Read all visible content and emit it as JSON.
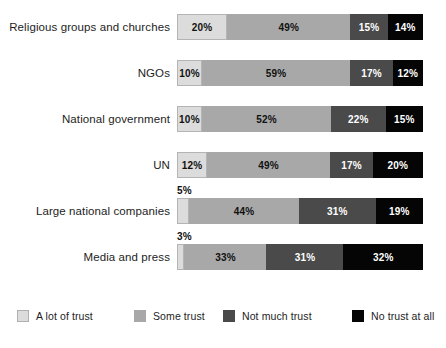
{
  "chart_data": {
    "type": "bar",
    "orientation": "horizontal",
    "stacked": true,
    "normalized_percent": true,
    "title": "",
    "xlabel": "",
    "ylabel": "",
    "xlim": [
      0,
      100
    ],
    "grid": false,
    "legend_position": "bottom",
    "categories": [
      "Religious groups and churches",
      "NGOs",
      "National government",
      "UN",
      "Large national companies",
      "Media and press"
    ],
    "series": [
      {
        "name": "A lot of trust",
        "color": "#dcdcdc",
        "values": [
          20,
          10,
          10,
          12,
          5,
          3
        ]
      },
      {
        "name": "Some trust",
        "color": "#a8a8a8",
        "values": [
          49,
          59,
          52,
          49,
          44,
          33
        ]
      },
      {
        "name": "Not much trust",
        "color": "#4a4a4a",
        "values": [
          15,
          17,
          22,
          17,
          31,
          31
        ]
      },
      {
        "name": "No trust at all",
        "color": "#050505",
        "values": [
          14,
          12,
          15,
          20,
          19,
          32
        ]
      }
    ],
    "value_labels": [
      [
        "20%",
        "49%",
        "15%",
        "14%"
      ],
      [
        "10%",
        "59%",
        "17%",
        "12%"
      ],
      [
        "10%",
        "52%",
        "22%",
        "15%"
      ],
      [
        "12%",
        "49%",
        "17%",
        "20%"
      ],
      [
        "5%",
        "44%",
        "31%",
        "19%"
      ],
      [
        "3%",
        "33%",
        "31%",
        "32%"
      ]
    ],
    "labels_outside_bar": [
      {
        "row": 4,
        "series": 0,
        "text": "5%"
      },
      {
        "row": 5,
        "series": 0,
        "text": "3%"
      }
    ]
  },
  "legend": {
    "items": [
      {
        "label": "A lot of trust",
        "color": "#dcdcdc",
        "left": 17
      },
      {
        "label": "Some trust",
        "color": "#a8a8a8",
        "left": 134
      },
      {
        "label": "Not much trust",
        "color": "#4a4a4a",
        "left": 223
      },
      {
        "label": "No trust at all",
        "color": "#050505",
        "left": 352
      }
    ]
  },
  "layout": {
    "bar_left": 177,
    "bar_width": 246,
    "bar_height": 26,
    "row_tops": [
      14,
      60,
      106,
      152,
      198,
      244
    ],
    "min_inside_label_percent": 7
  }
}
